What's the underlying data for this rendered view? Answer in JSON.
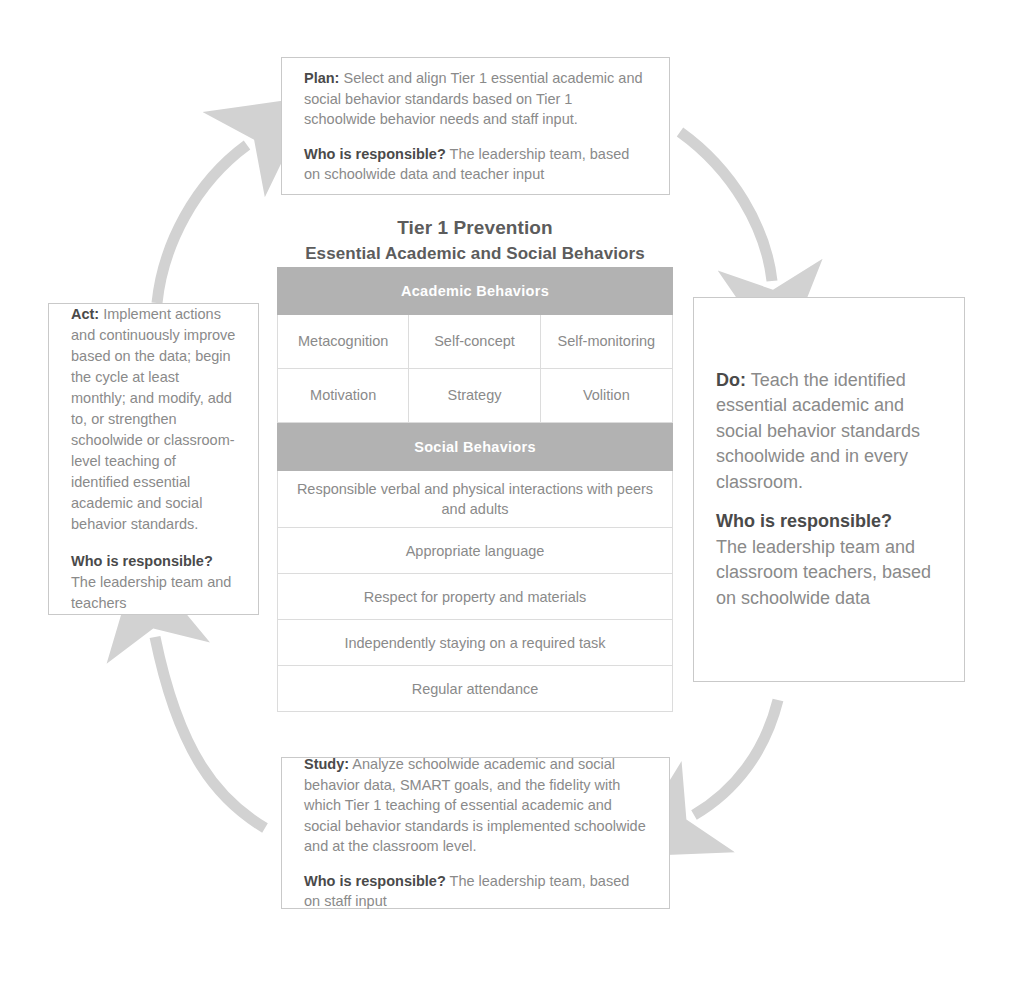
{
  "diagram": {
    "title_line1": "Tier 1 Prevention",
    "title_line2": "Essential Academic and Social Behaviors"
  },
  "colors": {
    "header_bar": "#b2b2b2",
    "body_text": "#8a8a8a",
    "lead_text": "#4a4a4a",
    "title_text": "#5c5c5c",
    "border": "#c9c9c9",
    "grid_line": "#dcdcdc",
    "arrow": "#d2d2d2"
  },
  "boxes": {
    "plan": {
      "label": "Plan:",
      "body": " Select and align Tier 1 essential academic and social behavior standards based on Tier 1 schoolwide behavior needs and staff input.",
      "who_label": "Who is responsible?",
      "who_body": " The leadership team, based on schoolwide data and teacher input"
    },
    "do": {
      "label": "Do:",
      "body": " Teach the identified essential academic and social behavior standards schoolwide and in every classroom.",
      "who_label": "Who is responsible?",
      "who_body": "The leadership team and classroom teachers, based on schoolwide data"
    },
    "study": {
      "label": "Study:",
      "body": " Analyze schoolwide academic and social behavior data, SMART goals, and the fidelity with which Tier 1 teaching of essential academic and social behavior standards is implemented schoolwide and at the classroom level.",
      "who_label": "Who is responsible?",
      "who_body": " The leadership team, based on staff input"
    },
    "act": {
      "label": "Act:",
      "body": " Implement actions and continuously improve based on the data; begin the cycle at least monthly; and modify, add to, or strengthen schoolwide or classroom-level teaching of identified essential academic and social behavior standards.",
      "who_label": "Who is responsible?",
      "who_body": "The leadership team and teachers"
    }
  },
  "table": {
    "academic_header": "Academic Behaviors",
    "academic_rows": [
      [
        "Metacognition",
        "Self-concept",
        "Self-monitoring"
      ],
      [
        "Motivation",
        "Strategy",
        "Volition"
      ]
    ],
    "social_header": "Social Behaviors",
    "social_rows": [
      "Responsible verbal and physical interactions with peers and adults",
      "Appropriate language",
      "Respect for property and materials",
      "Independently staying on a required task",
      "Regular attendance"
    ]
  },
  "arrows": {
    "act_to_plan": "curved-arrow-up-right",
    "plan_to_do": "curved-arrow-down-right",
    "do_to_study": "curved-arrow-down-left",
    "study_to_act": "curved-arrow-up-left"
  }
}
